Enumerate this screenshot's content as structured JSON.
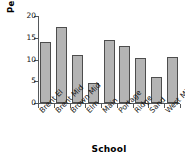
{
  "chart_data": {
    "type": "bar",
    "title": "",
    "subtitle": "",
    "xlabel": "School",
    "ylabel": "Percent",
    "categories": [
      "Brent El",
      "Brent Mid",
      "Brown Mid",
      "Elm",
      "Main",
      "Portage",
      "Ridge",
      "Sand",
      "West Mid"
    ],
    "values": [
      14.1,
      17.5,
      11.0,
      4.5,
      14.4,
      13.0,
      10.3,
      6.0,
      10.5
    ],
    "ylim": [
      0,
      20
    ],
    "yticks": [
      0,
      5,
      10,
      15,
      20
    ],
    "ytick_labels": [
      "0",
      "5",
      "10",
      "15",
      "20"
    ],
    "grid": false,
    "legend": false,
    "legend_position": "none",
    "bar_fill_color": "#b4b4b4",
    "bar_edge_color": "#4d4d4d",
    "axis_color": "#55585b",
    "text_color": "#141414",
    "background_color": "#ffffff",
    "xtick_label_rotation": -45
  },
  "axes": {
    "y_title": "Percent",
    "x_title": "School"
  }
}
